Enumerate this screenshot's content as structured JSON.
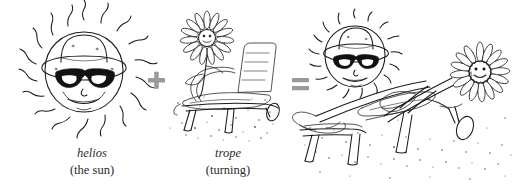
{
  "figure": {
    "kind": "etymology-illustration",
    "equation": "helios + trope = heliotrope",
    "background_color": "#ffffff",
    "ink_color": "#1a1a1a",
    "operator_color": "#9a9a9a"
  },
  "terms": [
    {
      "id": "helios",
      "root": "helios",
      "gloss": "(the sun)",
      "drawing": "smiling-sun-wearing-bucket-hat-and-sunglasses-with-wavy-rays"
    },
    {
      "id": "trope",
      "root": "trope",
      "gloss": "(turning)",
      "drawing": "sunflower-standing-beside-beach-lounge-chair-on-sand"
    }
  ],
  "operators": {
    "plus": "+",
    "equals": "="
  },
  "result": {
    "id": "heliotrope",
    "drawing": "sunflower-reclining-on-lounge-chair-turning-toward-sun-in-sunglasses",
    "root": "",
    "gloss": ""
  },
  "icons": {
    "sun": "sun-icon",
    "sunglasses": "sunglasses-icon",
    "bucket_hat": "hat-icon",
    "flower": "flower-icon",
    "lounge_chair": "lounge-chair-icon",
    "plus": "plus-icon",
    "equals": "equals-icon",
    "sand": "sand-stipple-icon"
  }
}
